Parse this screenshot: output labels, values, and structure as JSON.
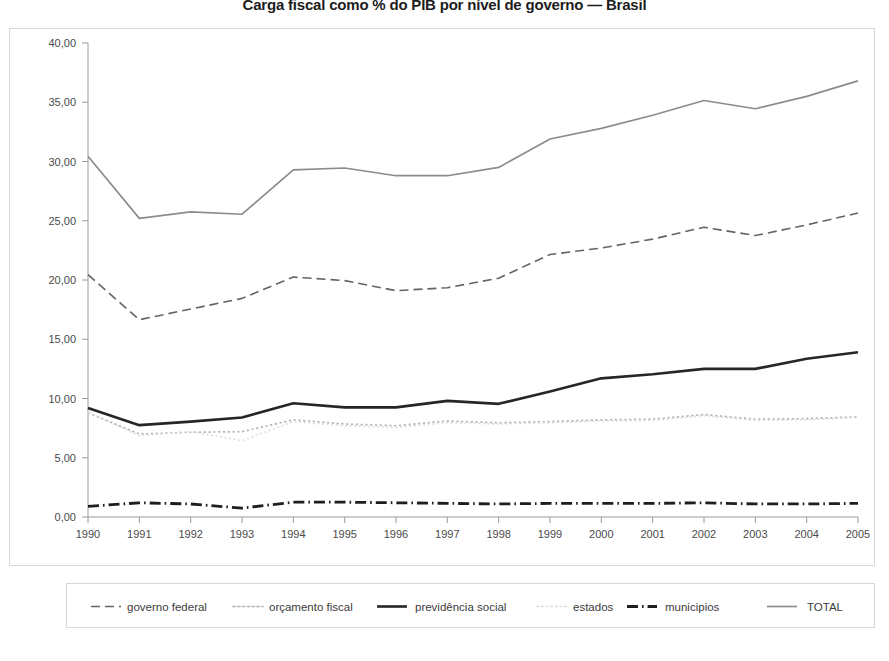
{
  "chart_data": {
    "type": "line",
    "title": "Carga fiscal como % do PIB por nível de governo — Brasil",
    "xlabel": "",
    "ylabel": "",
    "grid": false,
    "legend_position": "bottom",
    "categories": [
      "1990",
      "1991",
      "1992",
      "1993",
      "1994",
      "1995",
      "1996",
      "1997",
      "1998",
      "1999",
      "2000",
      "2001",
      "2002",
      "2003",
      "2004",
      "2005"
    ],
    "xlim": [
      1990,
      2005
    ],
    "ylim": [
      0,
      40
    ],
    "ytick_labels": [
      "0,00",
      "5,00",
      "10,00",
      "15,00",
      "20,00",
      "25,00",
      "30,00",
      "35,00",
      "40,00"
    ],
    "ytick_values": [
      0,
      5,
      10,
      15,
      20,
      25,
      30,
      35,
      40
    ],
    "series": [
      {
        "name": "governo federal",
        "style": "dashed",
        "color": "#646464",
        "width": 1.6,
        "values": [
          20.45,
          16.65,
          17.55,
          18.45,
          20.25,
          19.95,
          19.1,
          19.35,
          20.15,
          22.15,
          22.7,
          23.45,
          24.45,
          23.75,
          24.65,
          25.65
        ]
      },
      {
        "name": "orçamento fiscal",
        "style": "dotted",
        "color": "#b4b4b4",
        "width": 1.7,
        "values": [
          8.8,
          7.0,
          7.15,
          7.2,
          8.2,
          7.85,
          7.7,
          8.1,
          7.95,
          8.05,
          8.2,
          8.25,
          8.65,
          8.25,
          8.3,
          8.45
        ]
      },
      {
        "name": "previdência social",
        "style": "solid",
        "color": "#262626",
        "width": 2.6,
        "values": [
          9.2,
          7.75,
          8.05,
          8.4,
          9.6,
          9.25,
          9.25,
          9.8,
          9.55,
          10.6,
          11.7,
          12.05,
          12.5,
          12.5,
          13.35,
          13.9
        ]
      },
      {
        "name": "estados",
        "style": "light-dotted",
        "color": "#dcdcdc",
        "width": 1.6,
        "values": [
          8.85,
          6.85,
          7.2,
          6.45,
          8.05,
          7.7,
          7.55,
          7.95,
          7.85,
          7.95,
          8.1,
          8.15,
          8.55,
          8.15,
          8.2,
          8.4
        ]
      },
      {
        "name": "municipios",
        "style": "dashdot",
        "color": "#1e1e1e",
        "width": 2.8,
        "values": [
          0.9,
          1.2,
          1.1,
          0.75,
          1.25,
          1.25,
          1.2,
          1.15,
          1.1,
          1.15,
          1.15,
          1.15,
          1.2,
          1.1,
          1.1,
          1.15
        ]
      },
      {
        "name": "TOTAL",
        "style": "solid",
        "color": "#8c8c8c",
        "width": 1.7,
        "values": [
          30.45,
          25.2,
          25.75,
          25.55,
          29.3,
          29.45,
          28.8,
          28.8,
          29.5,
          31.9,
          32.8,
          33.9,
          35.15,
          34.45,
          35.5,
          36.8
        ]
      }
    ]
  },
  "legend": {
    "items": [
      {
        "label": "governo federal"
      },
      {
        "label": "orçamento fiscal"
      },
      {
        "label": "previdência social"
      },
      {
        "label": "estados"
      },
      {
        "label": "municipios"
      },
      {
        "label": "TOTAL"
      }
    ]
  }
}
